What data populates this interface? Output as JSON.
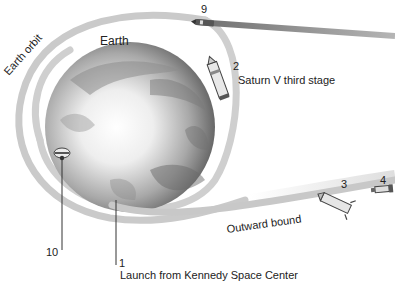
{
  "diagram": {
    "labels": {
      "earth_orbit": "Earth orbit",
      "earth": "Earth",
      "saturn_stage": "Saturn V third stage",
      "outward_bound": "Outward bound",
      "launch": "Launch from Kennedy Space Center"
    },
    "steps": {
      "s1": "1",
      "s2": "2",
      "s3": "3",
      "s4": "4",
      "s9": "9",
      "s10": "10"
    },
    "colors": {
      "orbit_path": "#c8c8c8",
      "return_path": "#9a9a9a",
      "earth_light": "#f4f4f4",
      "earth_dark": "#5a5a5a",
      "text": "#222222",
      "leader_line": "#333333"
    }
  }
}
